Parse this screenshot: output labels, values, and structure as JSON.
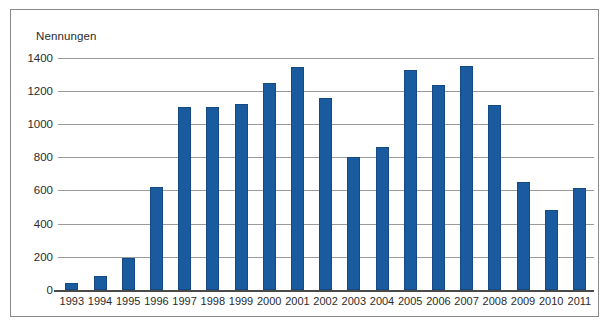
{
  "chart_data": {
    "type": "bar",
    "title": "",
    "subtitle": "",
    "xlabel": "",
    "ylabel": "Nennungen",
    "ylim": [
      0,
      1400
    ],
    "yticks": [
      0,
      200,
      400,
      600,
      800,
      1000,
      1200,
      1400
    ],
    "ytick_labels": [
      "0",
      "200",
      "400",
      "600",
      "800",
      "1000",
      "1200",
      "1400"
    ],
    "grid": true,
    "legend": null,
    "bar_color": "#1a5a9e",
    "categories": [
      "1993",
      "1994",
      "1995",
      "1996",
      "1997",
      "1998",
      "1999",
      "2000",
      "2001",
      "2002",
      "2003",
      "2004",
      "2005",
      "2006",
      "2007",
      "2008",
      "2009",
      "2010",
      "2011"
    ],
    "values": [
      40,
      85,
      195,
      620,
      1100,
      1100,
      1120,
      1245,
      1345,
      1155,
      800,
      860,
      1325,
      1235,
      1350,
      1115,
      650,
      480,
      615
    ]
  }
}
